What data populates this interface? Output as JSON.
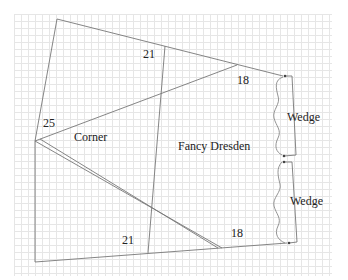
{
  "diagram": {
    "type": "quilt-block-template",
    "colors": {
      "line": "#777777",
      "grid": "#e6e6e6",
      "text": "#222222",
      "background": "#ffffff"
    },
    "labels": {
      "angle_top": "21",
      "angle_bottom": "21",
      "angle_top_right": "18",
      "angle_bottom_right": "18",
      "angle_left": "25",
      "corner": "Corner",
      "fancy_dresden": "Fancy Dresden",
      "wedge_top": "Wedge",
      "wedge_bottom": "Wedge"
    }
  }
}
